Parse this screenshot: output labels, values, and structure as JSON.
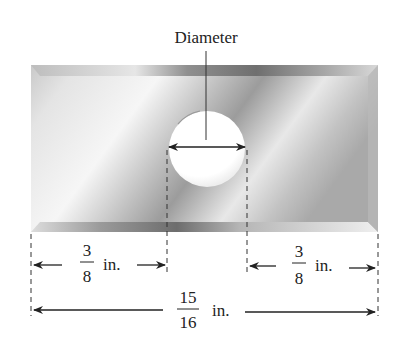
{
  "diagram": {
    "callout_label": "Diameter",
    "dimensions": {
      "left_margin": {
        "numerator": "3",
        "denominator": "8",
        "unit": "in."
      },
      "right_margin": {
        "numerator": "3",
        "denominator": "8",
        "unit": "in."
      },
      "total_width": {
        "numerator": "15",
        "denominator": "16",
        "unit": "in."
      }
    },
    "shapes": {
      "plate": "rectangular-metal-plate",
      "hole": "circular-hole"
    },
    "colors": {
      "plate_light": "#f2f2f2",
      "plate_mid": "#c8c8c8",
      "plate_dark": "#8a8a8a",
      "line": "#222222",
      "background": "#ffffff"
    }
  }
}
